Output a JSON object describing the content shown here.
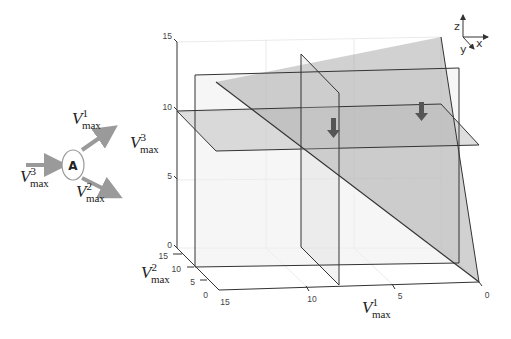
{
  "node": {
    "label": "A",
    "inputs": [
      {
        "var": "V",
        "sub": "max",
        "sup": "3"
      }
    ],
    "outputs": [
      {
        "var": "V",
        "sub": "max",
        "sup": "1"
      },
      {
        "var": "V",
        "sub": "max",
        "sup": "2"
      }
    ]
  },
  "axes": {
    "z_label": {
      "var": "V",
      "sub": "max",
      "sup": "3"
    },
    "y_label": {
      "var": "V",
      "sub": "max",
      "sup": "2"
    },
    "x_label": {
      "var": "V",
      "sub": "max",
      "sup": "1"
    },
    "z_ticks": [
      "15",
      "10",
      "5",
      "0"
    ],
    "y_ticks": [
      "15",
      "10",
      "5",
      "0"
    ],
    "x_ticks": [
      "15",
      "10",
      "5",
      "0"
    ]
  },
  "orientation_triad": {
    "z": "z",
    "x": "x",
    "y": "y"
  },
  "colors": {
    "plane_fill": "#9a9a9a",
    "edge": "#333333",
    "arrow": "#555555",
    "node_arrow": "#9a9a9a"
  }
}
